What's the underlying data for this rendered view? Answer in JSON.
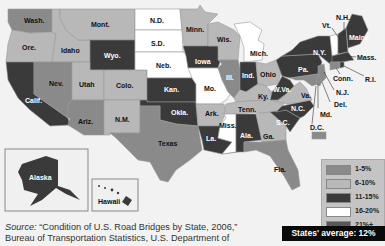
{
  "map": {
    "title": "Deficient U.S. Road Bridges by State",
    "colors": {
      "c1": "#8a8a8a",
      "c2": "#b8b8b8",
      "c3": "#3a3a3a",
      "c4": "#ffffff",
      "c5": "#585858"
    },
    "states": [
      {
        "abbr": "Wash.",
        "category": "1-5%"
      },
      {
        "abbr": "Ore.",
        "category": "6-10%"
      },
      {
        "abbr": "Calif.",
        "category": "11-15%"
      },
      {
        "abbr": "Idaho",
        "category": "6-10%"
      },
      {
        "abbr": "Nev.",
        "category": "1-5%"
      },
      {
        "abbr": "Mont.",
        "category": "6-10%"
      },
      {
        "abbr": "Wyo.",
        "category": "11-15%"
      },
      {
        "abbr": "Utah",
        "category": "6-10%"
      },
      {
        "abbr": "Colo.",
        "category": "6-10%"
      },
      {
        "abbr": "Ariz.",
        "category": "1-5%"
      },
      {
        "abbr": "N.M.",
        "category": "6-10%"
      },
      {
        "abbr": "N.D.",
        "category": "16-20%"
      },
      {
        "abbr": "S.D.",
        "category": "16-20%"
      },
      {
        "abbr": "Neb.",
        "category": "16-20%"
      },
      {
        "abbr": "Kan.",
        "category": "11-15%"
      },
      {
        "abbr": "Okla.",
        "category": "11-15%"
      },
      {
        "abbr": "Texas",
        "category": "1-5%"
      },
      {
        "abbr": "Minn.",
        "category": "6-10%"
      },
      {
        "abbr": "Iowa",
        "category": "11-15%"
      },
      {
        "abbr": "Mo.",
        "category": "16-20%"
      },
      {
        "abbr": "Ark.",
        "category": "6-10%"
      },
      {
        "abbr": "La.",
        "category": "11-15%"
      },
      {
        "abbr": "Wis.",
        "category": "6-10%"
      },
      {
        "abbr": "Ill.",
        "category": "1-5%"
      },
      {
        "abbr": "Mich.",
        "category": "16-20%"
      },
      {
        "abbr": "Ind.",
        "category": "11-15%"
      },
      {
        "abbr": "Ohio",
        "category": "6-10%"
      },
      {
        "abbr": "Ky.",
        "category": "6-10%"
      },
      {
        "abbr": "Tenn.",
        "category": "6-10%"
      },
      {
        "abbr": "Miss.",
        "category": "16-20%"
      },
      {
        "abbr": "Ala.",
        "category": "11-15%"
      },
      {
        "abbr": "Ga.",
        "category": "6-10%"
      },
      {
        "abbr": "Fla.",
        "category": "1-5%"
      },
      {
        "abbr": "S.C.",
        "category": "11-15%"
      },
      {
        "abbr": "N.C.",
        "category": "11-15%"
      },
      {
        "abbr": "Va.",
        "category": "6-10%"
      },
      {
        "abbr": "W.Va.",
        "category": "11-15%"
      },
      {
        "abbr": "Pa.",
        "category": "11-15%"
      },
      {
        "abbr": "N.Y.",
        "category": "11-15%"
      },
      {
        "abbr": "Vt.",
        "category": "16-20%"
      },
      {
        "abbr": "N.H.",
        "category": "11-15%"
      },
      {
        "abbr": "Maine",
        "category": "11-15%"
      },
      {
        "abbr": "Mass.",
        "category": "11-15%"
      },
      {
        "abbr": "R.I.",
        "category": "11-15%"
      },
      {
        "abbr": "Conn.",
        "category": "1-5%"
      },
      {
        "abbr": "N.J.",
        "category": "1-5%"
      },
      {
        "abbr": "Del.",
        "category": "1-5%"
      },
      {
        "abbr": "Md.",
        "category": "1-5%"
      },
      {
        "abbr": "D.C.",
        "category": "1-5%"
      },
      {
        "abbr": "Alaska",
        "category": "11-15%"
      },
      {
        "abbr": "Hawaii",
        "category": "11-15%"
      }
    ],
    "labels": {
      "wash": "Wash.",
      "ore": "Ore.",
      "calif": "Calif.",
      "idaho": "Idaho",
      "nev": "Nev.",
      "mont": "Mont.",
      "wyo": "Wyo.",
      "utah": "Utah",
      "colo": "Colo.",
      "ariz": "Ariz.",
      "nm": "N.M.",
      "nd": "N.D.",
      "sd": "S.D.",
      "neb": "Neb.",
      "kan": "Kan.",
      "okla": "Okla.",
      "texas": "Texas",
      "minn": "Minn.",
      "iowa": "Iowa",
      "mo": "Mo.",
      "ark": "Ark.",
      "la": "La.",
      "wis": "Wis.",
      "ill": "Ill.",
      "mich": "Mich.",
      "ind": "Ind.",
      "ohio": "Ohio",
      "ky": "Ky.",
      "tenn": "Tenn.",
      "miss": "Miss.",
      "ala": "Ala.",
      "ga": "Ga.",
      "fla": "Fla.",
      "sc": "S.C.",
      "nc": "N.C.",
      "va": "Va.",
      "wva": "W.Va.",
      "pa": "Pa.",
      "ny": "N.Y.",
      "vt": "Vt.",
      "nh": "N.H.",
      "maine": "Maine",
      "mass": "Mass.",
      "ri": "R.I.",
      "conn": "Conn.",
      "nj": "N.J.",
      "del": "Del.",
      "md": "Md.",
      "dc": "D.C.",
      "alaska": "Alaska",
      "hawaii": "Hawaii"
    }
  },
  "legend": {
    "items": [
      {
        "label": "1-5%",
        "color": "#8a8a8a"
      },
      {
        "label": "6-10%",
        "color": "#b8b8b8"
      },
      {
        "label": "11-15%",
        "color": "#3a3a3a"
      },
      {
        "label": "16-20%",
        "color": "#ffffff"
      },
      {
        "label": "21%+",
        "color": "#585858"
      }
    ],
    "average": "States' average: 12%"
  },
  "source": {
    "prefix": "Source:",
    "line1": " “Condition of U.S. Road Bridges by State, 2006,”",
    "line2": "Bureau of Transportation Statistics, U.S. Department of"
  }
}
